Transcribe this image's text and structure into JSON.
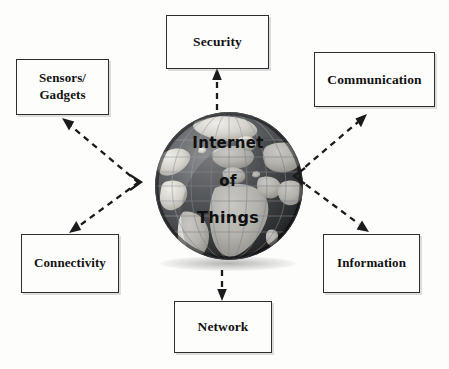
{
  "diagram": {
    "title": "Internet of Things",
    "center": {
      "icon": "globe-icon",
      "lines": [
        "Internet",
        "of",
        "Things"
      ]
    },
    "colors": {
      "background": "#fdfdfc",
      "box_border": "#2e2e2e",
      "text": "#121212",
      "arrow": "#1b1b1b",
      "globe_ocean": "#46484a",
      "globe_land": "#d8d6d0"
    },
    "nodes": [
      {
        "id": "security",
        "label": "Security",
        "position": "top"
      },
      {
        "id": "sensors",
        "label": "Sensors/\nGadgets",
        "position": "top-left"
      },
      {
        "id": "communication",
        "label": "Communication",
        "position": "top-right"
      },
      {
        "id": "connectivity",
        "label": "Connectivity",
        "position": "bottom-left"
      },
      {
        "id": "information",
        "label": "Information",
        "position": "bottom-right"
      },
      {
        "id": "network",
        "label": "Network",
        "position": "bottom"
      }
    ],
    "connectors": [
      {
        "from": "center",
        "to": "security",
        "style": "dashed",
        "arrowhead": "end"
      },
      {
        "from": "center",
        "to": "sensors",
        "style": "dashed",
        "arrowhead": "end"
      },
      {
        "from": "center",
        "to": "communication",
        "style": "dashed",
        "arrowhead": "end"
      },
      {
        "from": "center",
        "to": "connectivity",
        "style": "dashed",
        "arrowhead": "end"
      },
      {
        "from": "center",
        "to": "information",
        "style": "dashed",
        "arrowhead": "end"
      },
      {
        "from": "center",
        "to": "network",
        "style": "dashed",
        "arrowhead": "end"
      }
    ]
  }
}
